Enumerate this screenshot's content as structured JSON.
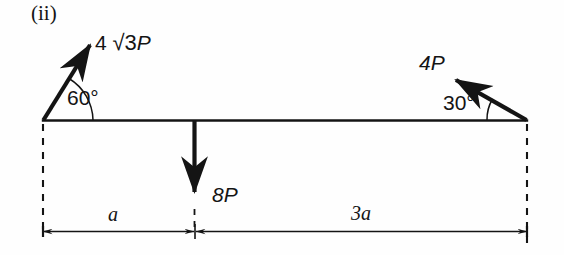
{
  "figure": {
    "part_label": "(ii)",
    "beam": {
      "left_x": 43,
      "right_x": 527,
      "y": 120
    },
    "forces": [
      {
        "name": "left-inclined-force",
        "magnitude_text": "4 √3P",
        "coefficient": "4",
        "radical": "√3",
        "symbol": "P",
        "angle_label": "60°",
        "angle_degrees": 60,
        "direction": "up-right from left support",
        "applied_at": "left support"
      },
      {
        "name": "right-inclined-force",
        "magnitude_text": "4P",
        "coefficient": "4",
        "symbol": "P",
        "angle_label": "30°",
        "angle_degrees": 30,
        "direction": "up-left from right support",
        "applied_at": "right support"
      },
      {
        "name": "vertical-point-load",
        "magnitude_text": "8P",
        "coefficient": "8",
        "symbol": "P",
        "direction": "downward",
        "applied_at": "point a from left support"
      }
    ],
    "dimensions": [
      {
        "name": "left-span",
        "label": "a",
        "from": "left support",
        "to": "8P load point"
      },
      {
        "name": "right-span",
        "label": "3a",
        "from": "8P load point",
        "to": "right support"
      }
    ],
    "colors": {
      "ink": "#141414",
      "background": "#fefefe"
    }
  }
}
